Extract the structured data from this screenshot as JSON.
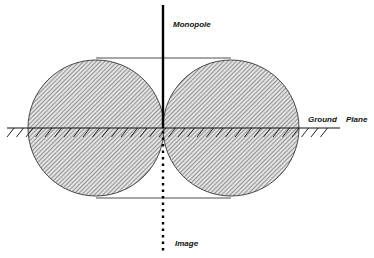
{
  "diagram": {
    "labels": {
      "monopole": "Monopole",
      "ground_plane_1": "Ground",
      "ground_plane_2": "Plane",
      "image": "Image"
    },
    "colors": {
      "stroke": "#111111",
      "hatch": "#333333",
      "fill": "#d8d8d8"
    }
  }
}
